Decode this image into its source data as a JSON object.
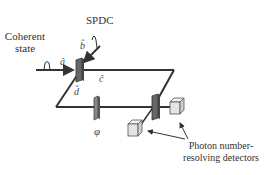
{
  "diagram": {
    "labels": {
      "coherent_line1": "Coherent",
      "coherent_line2": "state",
      "spdc": "SPDC",
      "detectors_line1": "Photon number-",
      "detectors_line2": "resolving detectors",
      "phase": "φ"
    },
    "modes": {
      "a": "â",
      "b": "b̂",
      "c": "ĉ",
      "d": "d̂"
    },
    "components": [
      "coherent-state-source",
      "spdc-source",
      "beam-splitter-1",
      "phase-shifter",
      "beam-splitter-2",
      "detector-1",
      "detector-2"
    ],
    "colors": {
      "line": "#333333",
      "beam_splitter": "#555555",
      "detector_face": "#e8e8e8"
    }
  }
}
